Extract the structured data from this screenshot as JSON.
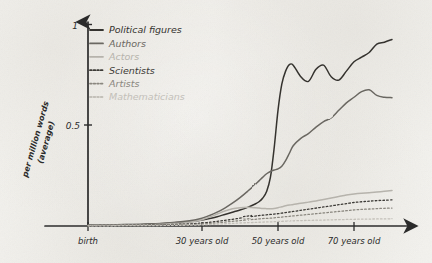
{
  "chart_data": {
    "type": "line",
    "title": "",
    "xlabel": "",
    "ylabel": "per million words (average)",
    "ylabel_line1": "per million words",
    "ylabel_line2": "(average)",
    "xlim": [
      0,
      80
    ],
    "ylim": [
      0,
      1.08
    ],
    "grid": false,
    "legend_position": "top-left",
    "x_tick_labels": [
      "birth",
      "30 years old",
      "50 years old",
      "70 years old"
    ],
    "x_tick_values": [
      0,
      30,
      50,
      70
    ],
    "y_tick_labels": [
      "0.5",
      "1"
    ],
    "y_tick_values": [
      0.5,
      1
    ],
    "x": [
      0,
      5,
      10,
      15,
      20,
      25,
      28,
      30,
      32,
      34,
      36,
      38,
      40,
      42,
      44,
      45,
      46,
      47,
      48,
      49,
      50,
      51,
      52,
      53,
      54,
      56,
      58,
      60,
      62,
      64,
      66,
      68,
      70,
      72,
      74,
      76,
      78,
      80
    ],
    "series": [
      {
        "name": "Political figures",
        "color": "#35332f",
        "style": "solid",
        "values": [
          0.005,
          0.006,
          0.008,
          0.01,
          0.014,
          0.02,
          0.026,
          0.032,
          0.04,
          0.05,
          0.062,
          0.074,
          0.086,
          0.1,
          0.118,
          0.13,
          0.15,
          0.185,
          0.26,
          0.42,
          0.62,
          0.76,
          0.83,
          0.865,
          0.862,
          0.8,
          0.775,
          0.84,
          0.862,
          0.8,
          0.782,
          0.83,
          0.88,
          0.905,
          0.93,
          0.975,
          0.985,
          1.0
        ]
      },
      {
        "name": "Authors",
        "color": "#6b6862",
        "style": "solid",
        "values": [
          0.004,
          0.005,
          0.007,
          0.01,
          0.015,
          0.024,
          0.032,
          0.042,
          0.056,
          0.074,
          0.096,
          0.122,
          0.152,
          0.186,
          0.222,
          0.242,
          0.262,
          0.28,
          0.292,
          0.3,
          0.306,
          0.32,
          0.35,
          0.39,
          0.43,
          0.47,
          0.495,
          0.53,
          0.56,
          0.58,
          0.62,
          0.66,
          0.69,
          0.72,
          0.73,
          0.7,
          0.69,
          0.688
        ]
      },
      {
        "name": "Actors",
        "color": "#b6b3ac",
        "style": "solid",
        "values": [
          0.003,
          0.004,
          0.005,
          0.007,
          0.01,
          0.016,
          0.024,
          0.034,
          0.048,
          0.064,
          0.08,
          0.092,
          0.098,
          0.1,
          0.098,
          0.096,
          0.094,
          0.093,
          0.092,
          0.094,
          0.098,
          0.103,
          0.108,
          0.112,
          0.115,
          0.122,
          0.128,
          0.134,
          0.142,
          0.15,
          0.158,
          0.166,
          0.172,
          0.176,
          0.178,
          0.182,
          0.186,
          0.19
        ]
      },
      {
        "name": "Scientists",
        "color": "#3d3b37",
        "style": "dotted",
        "values": [
          0.002,
          0.003,
          0.004,
          0.005,
          0.007,
          0.01,
          0.013,
          0.016,
          0.02,
          0.025,
          0.03,
          0.036,
          0.042,
          0.048,
          0.053,
          0.056,
          0.058,
          0.06,
          0.062,
          0.064,
          0.066,
          0.069,
          0.072,
          0.075,
          0.078,
          0.084,
          0.09,
          0.096,
          0.102,
          0.108,
          0.114,
          0.12,
          0.126,
          0.13,
          0.133,
          0.136,
          0.138,
          0.14
        ]
      },
      {
        "name": "Artists",
        "color": "#8a877f",
        "style": "dotted",
        "values": [
          0.002,
          0.002,
          0.003,
          0.004,
          0.005,
          0.007,
          0.009,
          0.011,
          0.014,
          0.017,
          0.021,
          0.025,
          0.029,
          0.033,
          0.036,
          0.038,
          0.04,
          0.041,
          0.042,
          0.044,
          0.046,
          0.048,
          0.05,
          0.052,
          0.054,
          0.058,
          0.062,
          0.066,
          0.07,
          0.074,
          0.078,
          0.082,
          0.086,
          0.089,
          0.091,
          0.093,
          0.095,
          0.096
        ]
      },
      {
        "name": "Mathematicians",
        "color": "#c3c0b9",
        "style": "dotted",
        "values": [
          0.001,
          0.001,
          0.002,
          0.002,
          0.003,
          0.004,
          0.005,
          0.006,
          0.008,
          0.01,
          0.012,
          0.014,
          0.016,
          0.018,
          0.019,
          0.02,
          0.021,
          0.022,
          0.022,
          0.023,
          0.024,
          0.025,
          0.026,
          0.027,
          0.028,
          0.029,
          0.03,
          0.031,
          0.032,
          0.033,
          0.034,
          0.035,
          0.036,
          0.037,
          0.037,
          0.038,
          0.038,
          0.039
        ]
      }
    ]
  },
  "legend": {
    "items": [
      {
        "label": "Political figures",
        "color": "#35332f",
        "style": "solid"
      },
      {
        "label": "Authors",
        "color": "#6b6862",
        "style": "solid"
      },
      {
        "label": "Actors",
        "color": "#b6b3ac",
        "style": "solid"
      },
      {
        "label": "Scientists",
        "color": "#3d3b37",
        "style": "dotted"
      },
      {
        "label": "Artists",
        "color": "#8a877f",
        "style": "dotted"
      },
      {
        "label": "Mathematicians",
        "color": "#c3c0b9",
        "style": "dotted"
      }
    ]
  },
  "axes": {
    "y_label_line1": "per million words",
    "y_label_line2": "(average)",
    "y_tick_1": "1",
    "y_tick_05": "0.5",
    "x_tick_0": "birth",
    "x_tick_30": "30 years old",
    "x_tick_50": "50 years old",
    "x_tick_70": "70 years old",
    "axis_color": "#2b2b2b"
  }
}
